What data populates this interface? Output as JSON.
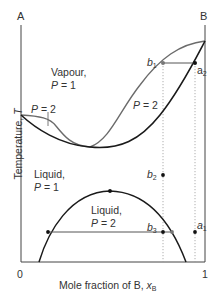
{
  "diagram": {
    "title": "",
    "axes": {
      "left_end_label": "A",
      "right_end_label": "B",
      "x_label_prefix": "Mole fraction of B, ",
      "x_label_var": "x",
      "x_label_sub": "B",
      "y_label_prefix": "Temperature, ",
      "y_label_var": "T",
      "x_tick_0": "0",
      "x_tick_1": "1"
    },
    "regions": {
      "vapour_line1": "Vapour,",
      "vapour_line2_var": "P",
      "vapour_line2_rest": " = 1",
      "left_lens_var": "P",
      "left_lens_rest": " = 2",
      "right_lens_var": "P",
      "right_lens_rest": " = 2",
      "liquid_line1": "Liquid,",
      "liquid_line2_var": "P",
      "liquid_line2_rest": " = 1",
      "dome_line1": "Liquid,",
      "dome_line2_var": "P",
      "dome_line2_rest": " = 2"
    },
    "points": {
      "b1": {
        "letter": "b",
        "sub": "1"
      },
      "a2": {
        "letter": "a",
        "sub": "2"
      },
      "b2": {
        "letter": "b",
        "sub": "2"
      },
      "b3": {
        "letter": "b",
        "sub": "3"
      },
      "a1": {
        "letter": "a",
        "sub": "1"
      }
    },
    "colors": {
      "axis": "#444444",
      "liquidus": "#1a1a1a",
      "vapour_curve": "#6b6b6b",
      "dotted": "#999999"
    }
  }
}
